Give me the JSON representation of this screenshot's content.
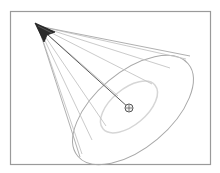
{
  "diagram": {
    "title": "",
    "colors": {
      "background": "#ffffff",
      "frame": "#9a9a9a",
      "arrowhead": "#2a2a2a",
      "axis_line": "#5a5a5a",
      "cone_lines": "#c4c4c4",
      "outer_ellipse": "#a8a8a8",
      "inner_ellipse": "#d6d6d6",
      "target": "#555555"
    },
    "frame": {
      "x": 10,
      "y": 11,
      "width": 201,
      "height": 154
    },
    "apex": {
      "x": 36,
      "y": 24
    },
    "target": {
      "x": 129,
      "y": 108,
      "radius": 4
    },
    "outer_ellipse": {
      "cx": 133,
      "cy": 110,
      "rx": 72,
      "ry": 38,
      "rotate": -40
    },
    "inner_ellipse": {
      "cx": 129,
      "cy": 107,
      "rx": 34,
      "ry": 18,
      "rotate": -40
    },
    "icons": {
      "apex": "arrowhead-icon",
      "target": "crosshair-target-icon"
    }
  }
}
